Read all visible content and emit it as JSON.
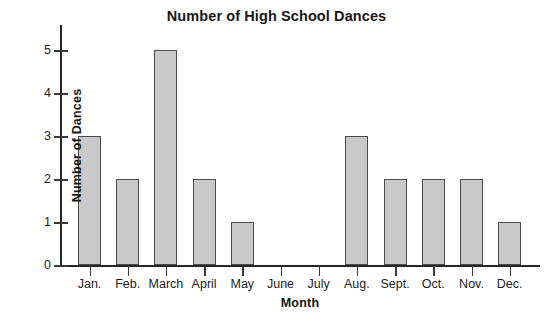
{
  "chart_data": {
    "type": "bar",
    "title": "Number of High School Dances",
    "xlabel": "Month",
    "ylabel": "Number of Dances",
    "categories": [
      "Jan.",
      "Feb.",
      "March",
      "April",
      "May",
      "June",
      "July",
      "Aug.",
      "Sept.",
      "Oct.",
      "Nov.",
      "Dec."
    ],
    "values": [
      3,
      2,
      5,
      2,
      1,
      0,
      0,
      3,
      2,
      2,
      2,
      1
    ],
    "ylim": [
      0,
      5
    ],
    "ytick_labels": [
      "0",
      "1",
      "2",
      "3",
      "4",
      "5"
    ],
    "yticks": [
      0,
      1,
      2,
      3,
      4,
      5
    ],
    "grid": false,
    "legend": false,
    "bar_color": "#c9c9c9",
    "bar_border_color": "#4a4a4a",
    "axis_color": "#262626",
    "background": "#ffffff"
  }
}
